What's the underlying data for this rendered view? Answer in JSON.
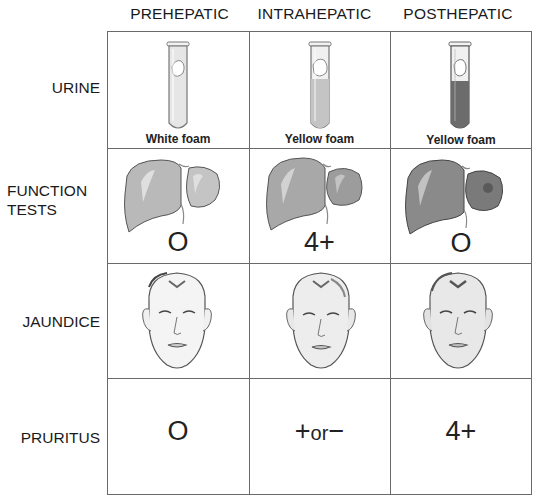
{
  "columns": [
    {
      "label": "PREHEPATIC"
    },
    {
      "label": "INTRAHEPATIC"
    },
    {
      "label": "POSTHEPATIC"
    }
  ],
  "rows": [
    {
      "label_lines": [
        "URINE"
      ]
    },
    {
      "label_lines": [
        "FUNCTION",
        "TESTS"
      ]
    },
    {
      "label_lines": [
        "JAUNDICE"
      ]
    },
    {
      "label_lines": [
        "PRURITUS"
      ]
    }
  ],
  "urine": {
    "cells": [
      {
        "caption": "White foam",
        "icon": "test-tube-icon",
        "fill_color": "#e6e6e6",
        "fill_level": "full-light"
      },
      {
        "caption": "Yellow foam",
        "icon": "test-tube-icon",
        "fill_color": "#c4c4c4",
        "fill_level": "full-medium"
      },
      {
        "caption": "Yellow foam",
        "icon": "test-tube-icon",
        "fill_color": "#6c6c6c",
        "fill_level": "full-dark"
      }
    ]
  },
  "function_tests": {
    "cells": [
      {
        "value": "O",
        "icon": "liver-icon",
        "shade": "#b9b9b9"
      },
      {
        "value": "4+",
        "icon": "liver-icon",
        "shade": "#a6a6a6"
      },
      {
        "value": "O",
        "icon": "liver-icon",
        "shade": "#8a8a8a"
      }
    ]
  },
  "jaundice": {
    "cells": [
      {
        "icon": "face-icon",
        "skin_shade": "#f4f4f4"
      },
      {
        "icon": "face-icon",
        "skin_shade": "#eeeeee"
      },
      {
        "icon": "face-icon",
        "skin_shade": "#e8e8e8"
      }
    ]
  },
  "pruritus": {
    "cells": [
      {
        "value": "O"
      },
      {
        "value_plus": "+",
        "value_or": "or",
        "value_minus": "−"
      },
      {
        "value": "4+"
      }
    ]
  }
}
